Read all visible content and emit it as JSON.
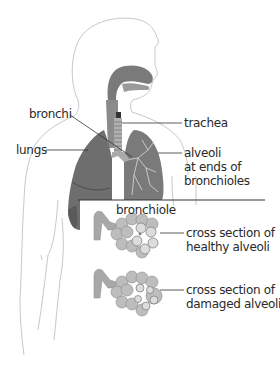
{
  "diagram": {
    "labels": {
      "bronchi": "bronchi",
      "lungs": "lungs",
      "trachea": "trachea",
      "alveoli_1": "alveoli",
      "alveoli_2": "at ends of",
      "alveoli_3": "bronchioles",
      "bronchiole": "bronchiole",
      "healthy_1": "cross section of",
      "healthy_2": "healthy alveoli",
      "damaged_1": "cross section of",
      "damaged_2": "damaged alveoli"
    },
    "colors": {
      "outline": "#c8c8c8",
      "lung_fill": "#6e6e6e",
      "lung_dark": "#555555",
      "airway": "#7a7a7a",
      "alveolus": "#bdbdbd",
      "leader_line": "#333333"
    }
  }
}
